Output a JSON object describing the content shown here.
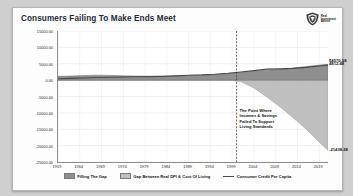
{
  "card": {
    "title": "Consumers Failing To Make Ends Meet",
    "logo": {
      "name": "real-investment-advice-logo",
      "line1": "Real",
      "line2": "Investment",
      "line3": "Advice"
    }
  },
  "annotation": {
    "line1": "The Point Where",
    "line2": "Incomes & Savings",
    "line3": "Failed To Support",
    "line4": "Living Standards",
    "marker_year": 2000
  },
  "data_labels": {
    "credit": "$4570.58",
    "filling": "4812.48",
    "gap": "-21438.28"
  },
  "chart_data": {
    "type": "area",
    "title": "Consumers Failing To Make Ends Meet",
    "xlabel": "",
    "ylabel": "",
    "grid": true,
    "legend_position": "bottom",
    "ylim": [
      -25000,
      15000
    ],
    "ytick_labels": [
      "15000.00",
      "10000.00",
      "5000.00",
      "0.00",
      "-5000.00",
      "-10000.00",
      "-15000.00",
      "-20000.00",
      "-25000.00"
    ],
    "yticks": [
      15000,
      10000,
      5000,
      0,
      -5000,
      -10000,
      -15000,
      -20000,
      -25000
    ],
    "xtick_labels": [
      "1959",
      "1964",
      "1969",
      "1974",
      "1979",
      "1984",
      "1989",
      "1994",
      "1999",
      "2004",
      "2009",
      "2014",
      "2019"
    ],
    "xticks": [
      1959,
      1964,
      1969,
      1974,
      1979,
      1984,
      1989,
      1994,
      1999,
      2004,
      2009,
      2014,
      2019
    ],
    "x": [
      1959,
      1962,
      1965,
      1968,
      1971,
      1974,
      1977,
      1980,
      1983,
      1986,
      1989,
      1992,
      1995,
      1998,
      2001,
      2004,
      2007,
      2010,
      2013,
      2016,
      2019,
      2021
    ],
    "series": [
      {
        "name": "Filling The Gap",
        "type": "area",
        "color": "#8f8f8f",
        "values": [
          1150,
          1250,
          1400,
          1500,
          1450,
          1300,
          1250,
          1200,
          1150,
          1250,
          1400,
          1500,
          1700,
          2000,
          2350,
          2700,
          3050,
          3300,
          3700,
          4150,
          4600,
          4812
        ]
      },
      {
        "name": "Gap Between Real DPI & Cost Of Living",
        "type": "area",
        "color": "#bfbfbf",
        "values": [
          500,
          600,
          650,
          700,
          600,
          450,
          400,
          350,
          300,
          350,
          400,
          350,
          200,
          100,
          -500,
          -2400,
          -5200,
          -8200,
          -11500,
          -15000,
          -19000,
          -21438
        ]
      },
      {
        "name": "Consumer Credit Per Capita",
        "type": "line",
        "color": "#4a4a4a",
        "values": [
          400,
          520,
          660,
          780,
          880,
          950,
          1030,
          1080,
          1150,
          1300,
          1500,
          1600,
          1800,
          2100,
          2500,
          2900,
          3350,
          3450,
          3600,
          3900,
          4300,
          4570
        ]
      }
    ]
  },
  "legend": [
    {
      "label": "Filling The Gap",
      "swatch": "area-swatch-dark"
    },
    {
      "label": "Gap Between Real DPI & Cost Of Living",
      "swatch": "area-swatch-light"
    },
    {
      "label": "Consumer Credit Per Capita",
      "swatch": "line-swatch"
    }
  ]
}
